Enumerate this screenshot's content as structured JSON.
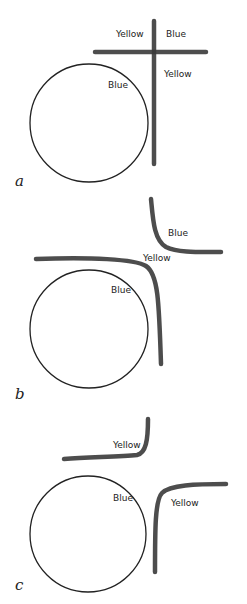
{
  "panels": [
    {
      "id": "a",
      "label": "a",
      "circle_label": "Blue",
      "region_labels": [
        "Yellow",
        "Blue",
        "Yellow"
      ]
    },
    {
      "id": "b",
      "label": "b",
      "circle_label": "Blue",
      "region_labels": [
        "Blue",
        "Yellow"
      ]
    },
    {
      "id": "c",
      "label": "c",
      "circle_label": "Blue",
      "region_labels": [
        "Yellow",
        "Yellow"
      ]
    }
  ],
  "colors": {
    "ink": "#222222",
    "stroke": "#3a3a3a",
    "background": "#ffffff"
  }
}
